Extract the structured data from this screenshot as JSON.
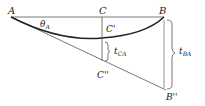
{
  "diagram": {
    "points": {
      "A": "A",
      "B": "B",
      "C": "C",
      "C_prime": "C'",
      "C_double_prime": "C''",
      "B_double_prime": "B''"
    },
    "angle": {
      "symbol": "θ",
      "sub": "A"
    },
    "deviations": {
      "t_CA": {
        "symbol": "t",
        "sub": "CA"
      },
      "t_BA": {
        "symbol": "t",
        "sub": "BA"
      }
    },
    "colors": {
      "line": "#222222",
      "thin_line": "#555555"
    }
  }
}
